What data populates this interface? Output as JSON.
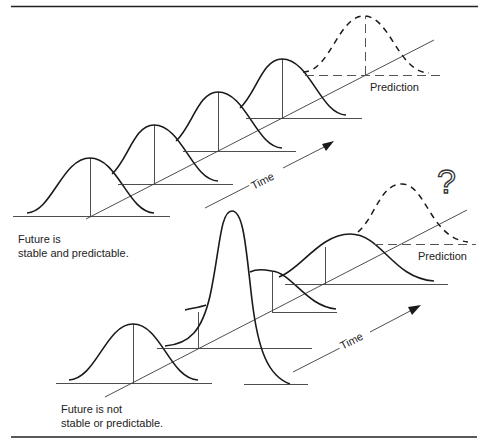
{
  "top_panel": {
    "caption_line1": "Future is",
    "caption_line2": "stable and predictable.",
    "time_label": "Time",
    "prediction_label": "Prediction"
  },
  "bottom_panel": {
    "caption_line1": "Future is not",
    "caption_line2": "stable or predictable.",
    "time_label": "Time",
    "prediction_label": "Prediction",
    "question_mark": "?"
  },
  "colors": {
    "line": "#1a1a1a",
    "background": "#ffffff"
  }
}
